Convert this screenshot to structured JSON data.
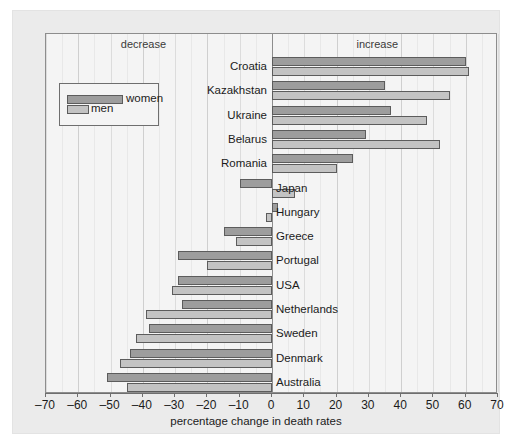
{
  "chart_data": {
    "type": "bar",
    "orientation": "horizontal",
    "title": "",
    "xlabel": "percentage change in death rates",
    "ylabel": "",
    "xlim": [
      -70,
      70
    ],
    "xticks": [
      -70,
      -60,
      -50,
      -40,
      -30,
      -20,
      -10,
      0,
      10,
      20,
      30,
      40,
      50,
      60,
      70
    ],
    "xtick_labels": [
      "–70",
      "–60",
      "–50",
      "–40",
      "–30",
      "–20",
      "–10",
      "0",
      "10",
      "20",
      "30",
      "40",
      "50",
      "60",
      "70"
    ],
    "grid": true,
    "grid_axis": "x",
    "legend_position": "upper-left",
    "annotations": [
      {
        "text": "decrease",
        "x": -40
      },
      {
        "text": "increase",
        "x": 33
      }
    ],
    "categories": [
      "Croatia",
      "Kazakhstan",
      "Ukraine",
      "Belarus",
      "Romania",
      "Japan",
      "Hungary",
      "Greece",
      "Portugal",
      "USA",
      "Netherlands",
      "Sweden",
      "Denmark",
      "Australia"
    ],
    "series": [
      {
        "name": "women",
        "color": "#9d9d9d",
        "values": [
          60,
          35,
          37,
          29,
          25,
          -10,
          2,
          -15,
          -29,
          -29,
          -28,
          -38,
          -44,
          -51
        ]
      },
      {
        "name": "men",
        "color": "#c3c3c3",
        "values": [
          61,
          55,
          48,
          52,
          20,
          7,
          -2,
          -11,
          -20,
          -31,
          -39,
          -42,
          -47,
          -45
        ]
      }
    ]
  },
  "legend": {
    "women_label": "women",
    "men_label": "men"
  },
  "colors": {
    "women": "#9d9d9d",
    "men": "#c3c3c3",
    "plot_background": "#f4f4f4",
    "panel_background": "#ebebeb",
    "bar_border": "#5c5c5c",
    "gridline": "#dcdcdc",
    "axis": "#6e6e6e"
  }
}
